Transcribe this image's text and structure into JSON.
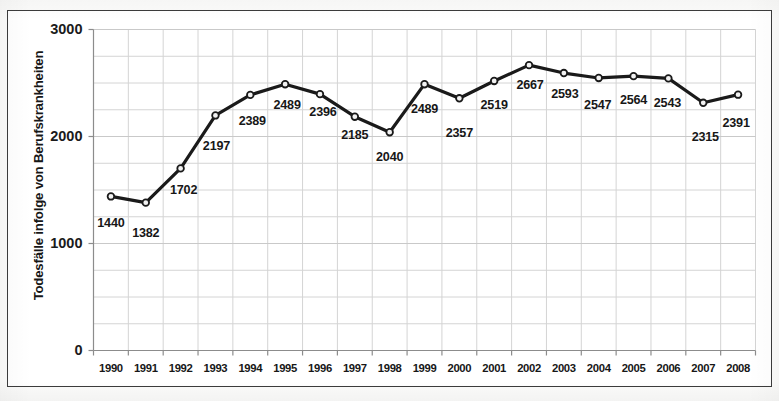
{
  "chart_data": {
    "type": "line",
    "title": "",
    "xlabel": "",
    "ylabel": "Todesfälle infolge von Berufskrankheiten",
    "ylim": [
      0,
      3000
    ],
    "y_ticks": [
      "0",
      "1000",
      "2000",
      "3000"
    ],
    "y_tick_values": [
      0,
      1000,
      2000,
      3000
    ],
    "grid": "horizontal and vertical gridlines, minor horizontal every 250",
    "legend": "none",
    "categories": [
      "1990",
      "1991",
      "1992",
      "1993",
      "1994",
      "1995",
      "1996",
      "1997",
      "1998",
      "1999",
      "2000",
      "2001",
      "2002",
      "2003",
      "2004",
      "2005",
      "2006",
      "2007",
      "2008"
    ],
    "values": [
      1440,
      1382,
      1702,
      2197,
      2389,
      2489,
      2396,
      2185,
      2040,
      2489,
      2357,
      2519,
      2667,
      2593,
      2547,
      2564,
      2543,
      2315,
      2391
    ],
    "data_labels": [
      "1440",
      "1382",
      "1702",
      "2197",
      "2389",
      "2489",
      "2396",
      "2185",
      "2040",
      "2489",
      "2357",
      "2519",
      "2667",
      "2593",
      "2547",
      "2564",
      "2543",
      "2315",
      "2391"
    ],
    "label_offsets_px": [
      {
        "dx": 0,
        "dy": 28
      },
      {
        "dx": 0,
        "dy": 31
      },
      {
        "dx": 3,
        "dy": 23
      },
      {
        "dx": 1,
        "dy": 32
      },
      {
        "dx": 2,
        "dy": 27
      },
      {
        "dx": 2,
        "dy": 22
      },
      {
        "dx": 3,
        "dy": 19
      },
      {
        "dx": 0,
        "dy": 19
      },
      {
        "dx": 0,
        "dy": 26
      },
      {
        "dx": 0,
        "dy": 26
      },
      {
        "dx": 0,
        "dy": 36
      },
      {
        "dx": 0,
        "dy": 25
      },
      {
        "dx": 1,
        "dy": 21
      },
      {
        "dx": 1,
        "dy": 22
      },
      {
        "dx": -1,
        "dy": 28
      },
      {
        "dx": 0,
        "dy": 25
      },
      {
        "dx": -1,
        "dy": 26
      },
      {
        "dx": 2,
        "dy": 35
      },
      {
        "dx": -2,
        "dy": 29
      }
    ],
    "series_color": "#1a1a1a",
    "marker": "circle-open",
    "marker_fill": "#f2f2f2",
    "gridline_color": "#d4d4d4",
    "axis_color": "#8c8c8c"
  }
}
